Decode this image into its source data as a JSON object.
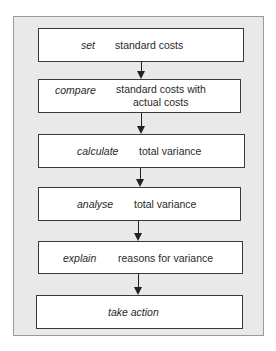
{
  "diagram": {
    "type": "flowchart",
    "direction": "top-to-bottom",
    "steps": [
      {
        "verb": "set",
        "object": "standard costs"
      },
      {
        "verb": "compare",
        "object_line1": "standard costs with",
        "object_line2": "actual costs"
      },
      {
        "verb": "calculate",
        "object": "total variance"
      },
      {
        "verb": "analyse",
        "object": "total variance"
      },
      {
        "verb": "explain",
        "object": "reasons for variance"
      },
      {
        "verb": "take action",
        "object": ""
      }
    ],
    "connectors": [
      "arrow-down",
      "arrow-down",
      "arrow-down",
      "arrow-down",
      "arrow-down"
    ],
    "colors": {
      "frame_background": "#e9e9e9",
      "frame_border": "#9a9a9a",
      "box_background": "#ffffff",
      "box_border": "#3a3a3a",
      "arrow": "#222222"
    }
  }
}
